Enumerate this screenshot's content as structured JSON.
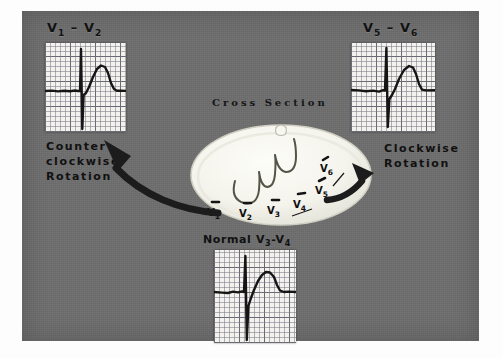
{
  "figure": {
    "panel_color": "#6e6e6e",
    "background_color": "#ffffff"
  },
  "center": {
    "cross_section_label": "Cross Section",
    "lead_markers": [
      {
        "name": "v1-marker",
        "label": "V",
        "sub": "1"
      },
      {
        "name": "v2-marker",
        "label": "V",
        "sub": "2"
      },
      {
        "name": "v3-marker",
        "label": "V",
        "sub": "3"
      },
      {
        "name": "v4-marker",
        "label": "V",
        "sub": "4"
      },
      {
        "name": "v5-marker",
        "label": "V",
        "sub": "5"
      },
      {
        "name": "v6-marker",
        "label": "V",
        "sub": "6"
      }
    ]
  },
  "panels": {
    "left": {
      "title_lead_a": "V",
      "title_sub_a": "1",
      "title_dash": " – ",
      "title_lead_b": "V",
      "title_sub_b": "2",
      "rotation_line1": "Counter",
      "rotation_line2": "clockwise",
      "rotation_line3": "Rotation"
    },
    "right": {
      "title_lead_a": "V",
      "title_sub_a": "5",
      "title_dash": " – ",
      "title_lead_b": "V",
      "title_sub_b": "6",
      "rotation_line1": "Clockwise",
      "rotation_line2": "Rotation"
    },
    "bottom": {
      "normal_word": "Normal ",
      "title_lead_a": "V",
      "title_sub_a": "3",
      "title_dash": "-",
      "title_lead_b": "V",
      "title_sub_b": "4"
    }
  }
}
